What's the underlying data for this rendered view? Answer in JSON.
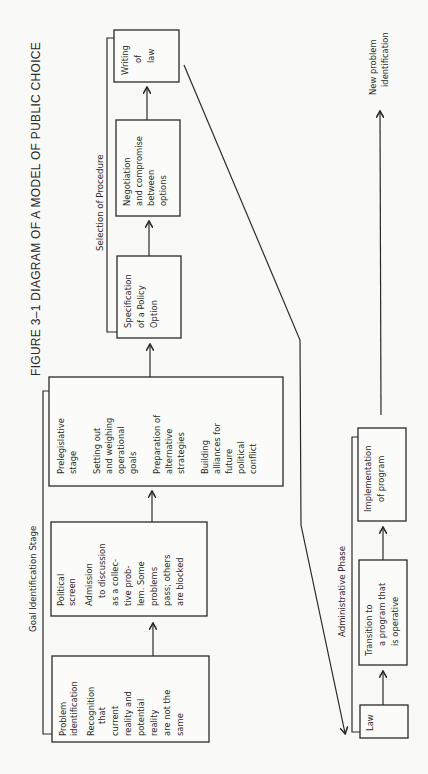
{
  "figure": {
    "title": "FIGURE 3–1  DIAGRAM OF A MODEL OF PUBLIC CHOICE"
  },
  "stages": {
    "goal_identification": {
      "label": "Goal Identification Stage",
      "boxes": [
        {
          "id": "problem-identification",
          "lines": [
            "Problem",
            "identification",
            "",
            "Recognition",
            "   that",
            "current",
            "reality and",
            "potential",
            "reality",
            "are not the",
            "same"
          ]
        },
        {
          "id": "political-screen",
          "lines": [
            "Political",
            "screen",
            "",
            "Admission",
            "  to discussion",
            "as a collec-",
            "tive prob-",
            "lem. Some",
            "problems",
            "pass; others",
            "are blocked"
          ]
        },
        {
          "id": "prelegislative-stage",
          "lines": [
            "Prelegislative",
            "stage",
            "",
            "",
            "Setting out",
            "and weighing",
            "operational",
            "goals",
            "",
            "",
            "Preparation of",
            "alternative",
            "strategies",
            "",
            "",
            "Building",
            "alliances for",
            "future",
            "political",
            "conflict"
          ]
        }
      ]
    },
    "selection_of_procedure": {
      "label": "Selection of Procedure",
      "boxes": [
        {
          "id": "specification-of-policy-option",
          "lines": [
            "Specification",
            "of a Policy",
            "Option"
          ]
        },
        {
          "id": "negotiation-and-compromise",
          "lines": [
            "Negotiation",
            "and compromise",
            "between",
            "options"
          ]
        },
        {
          "id": "writing-of-law",
          "lines": [
            "Writing",
            "of",
            "law"
          ]
        }
      ]
    },
    "administrative_phase": {
      "label": "Administrative Phase",
      "boxes": [
        {
          "id": "law",
          "lines": [
            "Law"
          ]
        },
        {
          "id": "transition-to-program",
          "lines": [
            "Transition to",
            "  a program that",
            "  is operative"
          ]
        },
        {
          "id": "implementation-of-program",
          "lines": [
            "Implementation",
            "of program"
          ]
        }
      ]
    }
  },
  "outcome": {
    "label_lines": [
      "New problem",
      "identification"
    ]
  }
}
